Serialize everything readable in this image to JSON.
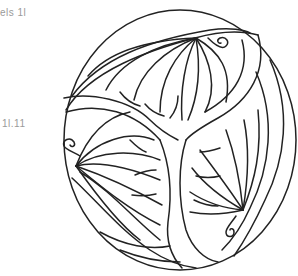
{
  "text_fragments": {
    "top": "els  1l",
    "middle": "1l.11"
  },
  "artwork": {
    "subject": "circular triskelion ornament with three leaf fans and spiral curls",
    "style": "black line art on white (coloring page)",
    "stroke_color": "#222222",
    "background_color": "#ffffff",
    "fragment_text_color": "#9a9a9a"
  }
}
